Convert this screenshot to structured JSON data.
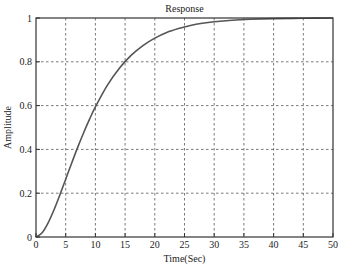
{
  "chart_data": {
    "type": "line",
    "title": "Response",
    "xlabel": "Time(Sec)",
    "ylabel": "Amplitude",
    "xlim": [
      0,
      50
    ],
    "ylim": [
      0,
      1
    ],
    "xticks": [
      0,
      5,
      10,
      15,
      20,
      25,
      30,
      35,
      40,
      45,
      50
    ],
    "yticks": [
      0,
      0.2,
      0.4,
      0.6,
      0.8,
      1
    ],
    "ytick_labels": [
      "0",
      "0.2",
      "0.4",
      "0.6",
      "0.8",
      "1"
    ],
    "grid": true,
    "series": [
      {
        "name": "Response",
        "color": "#555555",
        "x": [
          0,
          1,
          2,
          3,
          4,
          5,
          6,
          7,
          8,
          9,
          10,
          12,
          14,
          16,
          18,
          20,
          22,
          24,
          26,
          28,
          30,
          33,
          36,
          40,
          45,
          50
        ],
        "y": [
          0,
          0.018,
          0.062,
          0.122,
          0.191,
          0.264,
          0.337,
          0.408,
          0.475,
          0.537,
          0.594,
          0.692,
          0.769,
          0.829,
          0.874,
          0.908,
          0.934,
          0.952,
          0.966,
          0.976,
          0.983,
          0.99,
          0.994,
          0.997,
          0.999,
          1.0
        ]
      }
    ]
  }
}
